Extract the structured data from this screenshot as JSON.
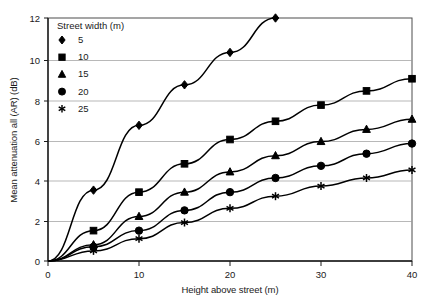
{
  "chart_data": {
    "type": "line",
    "title": "",
    "xlabel": "Height above street (m)",
    "ylabel": "Mean attenuation all (AR) (dB)",
    "xlim": [
      0,
      40
    ],
    "ylim": [
      0,
      12
    ],
    "xticks": [
      0,
      10,
      20,
      30,
      40
    ],
    "yticks": [
      0,
      2,
      4,
      6,
      8,
      10,
      12
    ],
    "xtick_labels": [
      "0",
      "10",
      "20",
      "30",
      "40"
    ],
    "ytick_labels": [
      "0",
      "2",
      "4",
      "6",
      "8",
      "10",
      "12"
    ],
    "grid": "horizontal",
    "legend_position": "top-left-inside",
    "legend_title": "Street width (m)",
    "x": [
      0,
      5,
      10,
      15,
      20,
      25,
      30,
      35,
      40
    ],
    "series": [
      {
        "name": "5",
        "marker": "diamond",
        "x": [
          0,
          5,
          10,
          15,
          20,
          25
        ],
        "values": [
          0,
          3.5,
          6.7,
          8.7,
          10.3,
          12.0
        ]
      },
      {
        "name": "10",
        "marker": "square",
        "x": [
          0,
          5,
          10,
          15,
          20,
          25,
          30,
          35,
          40
        ],
        "values": [
          0,
          1.5,
          3.4,
          4.8,
          6.0,
          6.9,
          7.7,
          8.4,
          9.0
        ]
      },
      {
        "name": "15",
        "marker": "triangle",
        "x": [
          0,
          5,
          10,
          15,
          20,
          25,
          30,
          35,
          40
        ],
        "values": [
          0,
          0.8,
          2.2,
          3.4,
          4.4,
          5.2,
          5.9,
          6.5,
          7.0
        ]
      },
      {
        "name": "20",
        "marker": "circle",
        "x": [
          0,
          5,
          10,
          15,
          20,
          25,
          30,
          35,
          40
        ],
        "values": [
          0,
          0.7,
          1.5,
          2.5,
          3.4,
          4.1,
          4.7,
          5.3,
          5.8
        ]
      },
      {
        "name": "25",
        "marker": "star",
        "x": [
          0,
          5,
          10,
          15,
          20,
          25,
          30,
          35,
          40
        ],
        "values": [
          0,
          0.5,
          1.1,
          1.9,
          2.6,
          3.2,
          3.7,
          4.1,
          4.5
        ]
      }
    ],
    "colors": {
      "series": "#000000",
      "gridline": "#9a9a9a",
      "frame": "#4d4d4d",
      "text": "#1a1a1a",
      "background": "#ffffff"
    }
  },
  "legend": {
    "title": "Street width (m)",
    "entries": [
      {
        "label": "5",
        "marker": "diamond"
      },
      {
        "label": "10",
        "marker": "square"
      },
      {
        "label": "15",
        "marker": "triangle"
      },
      {
        "label": "20",
        "marker": "circle"
      },
      {
        "label": "25",
        "marker": "star"
      }
    ]
  }
}
